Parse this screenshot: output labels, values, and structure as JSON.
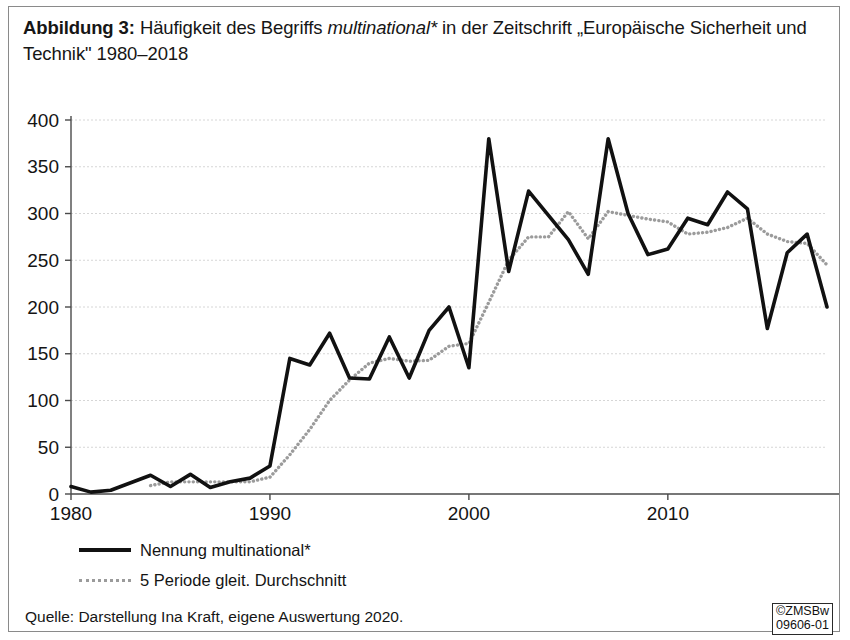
{
  "caption": {
    "lead": "Abbildung 3:",
    "rest_before_italic": " Häufigkeit des Begriffs ",
    "italic_term": "multinational*",
    "rest_after_italic": " in der Zeitschrift „Europäische Sicherheit und Technik\" 1980–2018"
  },
  "legend": {
    "series_label": "Nennung multinational*",
    "average_label": "5 Periode gleit. Durchschnitt"
  },
  "source": {
    "text": "Quelle: Darstellung Ina Kraft, eigene Auswertung 2020."
  },
  "stamp": {
    "line1": "©ZMSBw",
    "line2": "09606-01"
  },
  "colors": {
    "series": "#111111",
    "average": "#9b9b9b",
    "grid": "#d6d6d6",
    "axis": "#4a4a4a",
    "frame": "#8a8a8a"
  },
  "chart_data": {
    "type": "line",
    "title": "Häufigkeit des Begriffs multinational* in der Zeitschrift „Europäische Sicherheit und Technik\" 1980–2018",
    "xlabel": "",
    "ylabel": "",
    "xlim": [
      1980,
      2018
    ],
    "ylim": [
      0,
      400
    ],
    "ytick_labels": [
      "0",
      "50",
      "100",
      "150",
      "200",
      "250",
      "300",
      "350",
      "400"
    ],
    "yticks": [
      0,
      50,
      100,
      150,
      200,
      250,
      300,
      350,
      400
    ],
    "xtick_labels": [
      "1980",
      "1990",
      "2000",
      "2010"
    ],
    "xticks": [
      1980,
      1990,
      2000,
      2010
    ],
    "grid": true,
    "legend_position": "below-plot",
    "x": [
      1980,
      1981,
      1982,
      1983,
      1984,
      1985,
      1986,
      1987,
      1988,
      1989,
      1990,
      1991,
      1992,
      1993,
      1994,
      1995,
      1996,
      1997,
      1998,
      1999,
      2000,
      2001,
      2002,
      2003,
      2004,
      2005,
      2006,
      2007,
      2008,
      2009,
      2010,
      2011,
      2012,
      2013,
      2014,
      2015,
      2016,
      2017,
      2018
    ],
    "series": [
      {
        "name": "Nennung multinational*",
        "color": "#111111",
        "style": "solid",
        "values": [
          8,
          2,
          4,
          12,
          20,
          8,
          21,
          7,
          13,
          17,
          30,
          145,
          138,
          172,
          124,
          123,
          168,
          124,
          175,
          200,
          135,
          380,
          238,
          324,
          298,
          272,
          235,
          380,
          300,
          256,
          262,
          295,
          288,
          323,
          305,
          177,
          258,
          278,
          200
        ]
      },
      {
        "name": "5 Periode gleit. Durchschnitt",
        "color": "#9b9b9b",
        "style": "dotted",
        "note": "5-period moving average; starts at 1984",
        "values": [
          null,
          null,
          null,
          null,
          9,
          13,
          13,
          13,
          13,
          13,
          18,
          42,
          69,
          100,
          122,
          140,
          145,
          142,
          143,
          158,
          161,
          205,
          250,
          275,
          275,
          302,
          273,
          302,
          298,
          294,
          291,
          278,
          280,
          285,
          295,
          278,
          270,
          268,
          245
        ]
      }
    ]
  },
  "plot_geometry": {
    "left": 62,
    "right": 818,
    "top": 17,
    "bottom": 391,
    "width": 832,
    "height": 420
  }
}
